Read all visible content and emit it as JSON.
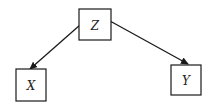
{
  "diagram": {
    "type": "directed-graph",
    "colors": {
      "stroke": "#1a1a1a",
      "text": "#222222",
      "background": "#ffffff"
    },
    "nodes": [
      {
        "id": "Z",
        "label": "Z",
        "x": 79,
        "y": 9,
        "w": 32,
        "h": 31
      },
      {
        "id": "X",
        "label": "X",
        "x": 16,
        "y": 69,
        "w": 30,
        "h": 32
      },
      {
        "id": "Y",
        "label": "Y",
        "x": 171,
        "y": 65,
        "w": 30,
        "h": 30
      }
    ],
    "edges": [
      {
        "from": "Z",
        "to": "X",
        "x1": 80,
        "y1": 25,
        "x2": 30,
        "y2": 69
      },
      {
        "from": "Z",
        "to": "Y",
        "x1": 110,
        "y1": 21,
        "x2": 188,
        "y2": 64
      }
    ]
  }
}
